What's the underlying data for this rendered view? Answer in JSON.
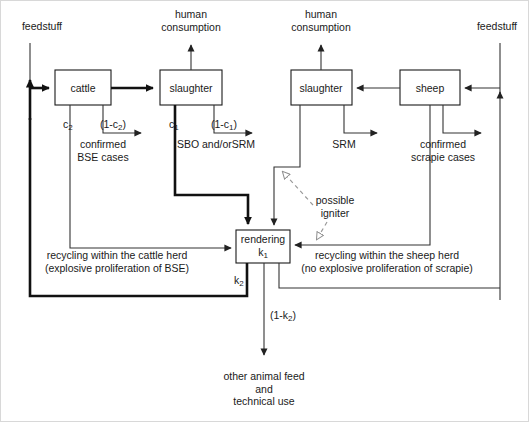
{
  "diagram": {
    "boxes": [
      {
        "id": "cattle",
        "label": "cattle",
        "x": 55,
        "y": 70,
        "w": 56,
        "h": 35
      },
      {
        "id": "slaughter_cattle",
        "label": "slaughter",
        "x": 160,
        "y": 70,
        "w": 62,
        "h": 35
      },
      {
        "id": "slaughter_sheep",
        "label": "slaughter",
        "x": 291,
        "y": 70,
        "w": 61,
        "h": 35
      },
      {
        "id": "sheep",
        "label": "sheep",
        "x": 400,
        "y": 70,
        "w": 60,
        "h": 35
      },
      {
        "id": "rendering",
        "label": "rendering",
        "sublabel": "k1",
        "x": 236,
        "y": 230,
        "w": 54,
        "h": 33
      }
    ],
    "labels": {
      "feedstuff_left": "feedstuff",
      "feedstuff_right": "feedstuff",
      "human_consumption_left": "human\nconsumption",
      "human_consumption_right": "human\nconsumption",
      "c2": "c2",
      "one_minus_c2": "(1-c2)",
      "confirmed_bse": "confirmed\nBSE cases",
      "c1": "c1",
      "one_minus_c1": "(1-c1)",
      "sbo_srm": "SBO and/orSRM",
      "srm": "SRM",
      "confirmed_scrapie": "confirmed\nscrapie cases",
      "possible_igniter": "possible\nigniter",
      "recycling_cattle": "recycling within the cattle herd\n(explosive proliferation of BSE)",
      "recycling_sheep": "recycling within the sheep herd\n(no explosive proliferation of scrapie)",
      "k2": "k2",
      "one_minus_k2": "(1-k2)",
      "other_animal_feed": "other animal feed\nand\ntechnical use"
    },
    "colors": {
      "stroke": "#1a1a1a",
      "thin": "#4d4d4d",
      "dashed": "#9a9a9a",
      "background": "#ffffff"
    }
  }
}
